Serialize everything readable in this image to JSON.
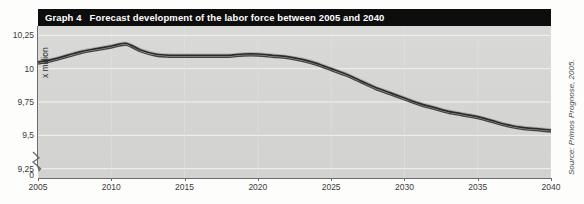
{
  "figure": {
    "label_number": "Graph 4",
    "title": "Forecast development of the labor force between 2005 and 2040",
    "source": "Source: Primos Prognose, 2005.",
    "axis_break_icon": "axis-break-zigzag"
  },
  "chart_data": {
    "type": "line",
    "title": "Graph 4  Forecast development of the labor force between 2005 and 2040",
    "xlabel": "",
    "ylabel": "x million",
    "x": [
      2005,
      2006,
      2007,
      2008,
      2009,
      2010,
      2011,
      2012,
      2013,
      2014,
      2015,
      2016,
      2017,
      2018,
      2019,
      2020,
      2021,
      2022,
      2023,
      2024,
      2025,
      2026,
      2027,
      2028,
      2029,
      2030,
      2031,
      2032,
      2033,
      2034,
      2035,
      2036,
      2037,
      2038,
      2039,
      2040
    ],
    "series": [
      {
        "name": "Labor force",
        "values": [
          10.05,
          10.07,
          10.1,
          10.13,
          10.15,
          10.17,
          10.19,
          10.14,
          10.11,
          10.1,
          10.1,
          10.1,
          10.1,
          10.1,
          10.11,
          10.11,
          10.1,
          10.09,
          10.07,
          10.04,
          10.0,
          9.96,
          9.91,
          9.86,
          9.82,
          9.78,
          9.74,
          9.71,
          9.68,
          9.66,
          9.64,
          9.61,
          9.58,
          9.56,
          9.55,
          9.54
        ]
      }
    ],
    "xlim": [
      2005,
      2040
    ],
    "ylim": [
      9.18,
      10.32
    ],
    "ytick_labels": [
      "10,25",
      "10",
      "9,75",
      "9,5",
      "9,25",
      "0"
    ],
    "ytick_values": [
      10.25,
      10.0,
      9.75,
      9.5,
      9.25,
      0
    ],
    "xtick_labels": [
      "2005",
      "2010",
      "2015",
      "2020",
      "2025",
      "2030",
      "2035",
      "2040"
    ],
    "xtick_values": [
      2005,
      2010,
      2015,
      2020,
      2025,
      2030,
      2035,
      2040
    ],
    "grid": true,
    "legend": "none",
    "axis_break": true,
    "line_color": "#2b2b2b",
    "plot_background": "#d6d6d4",
    "gridline_color": "#f2f2ef",
    "title_banner_color": "#0d0d0d",
    "title_text_color": "#ffffff"
  }
}
